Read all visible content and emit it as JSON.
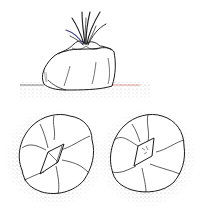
{
  "figure": {
    "panels": [
      {
        "id": "side-view",
        "label": "side view of plant body with leaf tuft"
      },
      {
        "id": "top-view-left",
        "label": "top view, left specimen"
      },
      {
        "id": "top-view-right",
        "label": "top view, right specimen"
      }
    ],
    "colors": {
      "ink": "#1a1a1a",
      "stipple": "#555555",
      "accent_red": "#c0392b",
      "accent_blue": "#3a3a8a",
      "background": "#ffffff"
    }
  }
}
